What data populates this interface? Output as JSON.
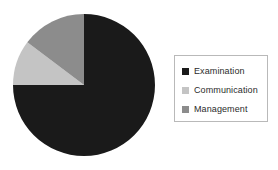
{
  "chart_data": {
    "type": "pie",
    "title": "",
    "labels": [
      "Examination",
      "Communication",
      "Management"
    ],
    "values": [
      75,
      10,
      15
    ],
    "unit": "%",
    "colors": [
      "#1a1a1a",
      "#c4c4c4",
      "#8c8c8c"
    ],
    "start_angle": 0,
    "direction": "clockwise",
    "legend_position": "right",
    "grid": false,
    "slices": [
      {
        "label": "Examination",
        "value": 75,
        "color": "#1a1a1a",
        "start_deg": 0,
        "end_deg": 270
      },
      {
        "label": "Communication",
        "value": 10,
        "color": "#c4c4c4",
        "start_deg": 270,
        "end_deg": 307
      },
      {
        "label": "Management",
        "value": 15,
        "color": "#8c8c8c",
        "start_deg": 307,
        "end_deg": 360
      }
    ]
  },
  "legend": {
    "items": [
      {
        "label": "Examination",
        "swatch_color": "#1a1a1a",
        "swatch_icon": "square-swatch-icon"
      },
      {
        "label": "Communication",
        "swatch_color": "#c4c4c4",
        "swatch_icon": "square-swatch-icon"
      },
      {
        "label": "Management",
        "swatch_color": "#8c8c8c",
        "swatch_icon": "square-swatch-icon"
      }
    ],
    "border_color": "#b9b9b9",
    "background": "#ffffff"
  },
  "canvas": {
    "background": "#ffffff",
    "pie_center_x": 84,
    "pie_center_y": 85,
    "pie_radius": 72
  }
}
